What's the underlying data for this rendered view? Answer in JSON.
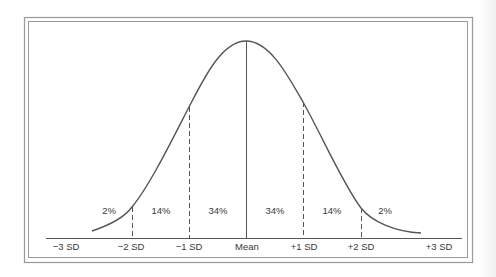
{
  "figure": {
    "type": "normal-distribution",
    "colors": {
      "curve": "#555555",
      "frame": "#9a9a9a",
      "text": "#3a3a3a",
      "background": "#ffffff"
    },
    "percent_labels": [
      "2%",
      "14%",
      "34%",
      "34%",
      "14%",
      "2%"
    ],
    "axis_labels": [
      "−3 SD",
      "−2 SD",
      "−1 SD",
      "Mean",
      "+1 SD",
      "+2 SD",
      "+3 SD"
    ],
    "regions": [
      {
        "from": "−3 SD",
        "to": "−2 SD",
        "percent": "2%"
      },
      {
        "from": "−2 SD",
        "to": "−1 SD",
        "percent": "14%"
      },
      {
        "from": "−1 SD",
        "to": "Mean",
        "percent": "34%"
      },
      {
        "from": "Mean",
        "to": "+1 SD",
        "percent": "34%"
      },
      {
        "from": "+1 SD",
        "to": "+2 SD",
        "percent": "14%"
      },
      {
        "from": "+2 SD",
        "to": "+3 SD",
        "percent": "2%"
      }
    ]
  }
}
